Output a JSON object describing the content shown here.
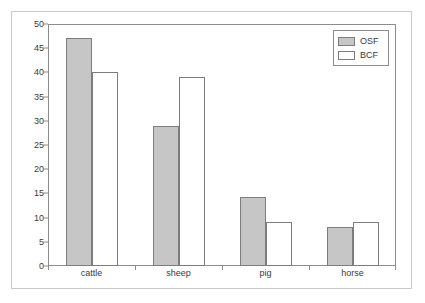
{
  "chart_data": {
    "type": "bar",
    "title": "",
    "xlabel": "",
    "ylabel": "",
    "categories": [
      "cattle",
      "sheep",
      "pig",
      "horse"
    ],
    "series": [
      {
        "name": "OSF",
        "color": "#c6c6c6",
        "values": [
          47.1,
          29.0,
          14.2,
          8.1
        ]
      },
      {
        "name": "BCF",
        "color": "#ffffff",
        "values": [
          40.0,
          39.0,
          9.0,
          9.1
        ]
      }
    ],
    "ylim": [
      0,
      50
    ],
    "yticks": [
      0,
      5,
      10,
      15,
      20,
      25,
      30,
      35,
      40,
      45,
      50
    ],
    "ytick_labels": [
      "0",
      "5",
      "10",
      "15",
      "20",
      "25",
      "30",
      "35",
      "40",
      "45",
      "50"
    ],
    "grid": false,
    "legend_position": "top-right",
    "legend_entries": [
      "OSF",
      "BCF"
    ],
    "annotations": []
  },
  "legend": {
    "entries": [
      {
        "label": "OSF",
        "swatch": "osf"
      },
      {
        "label": "BCF",
        "swatch": "bcf"
      }
    ]
  },
  "colors": {
    "osf_fill": "#c6c6c6",
    "bcf_fill": "#ffffff",
    "bar_stroke": "#7d7d7d",
    "axis": "#8c8c8c",
    "text": "#3a3a3a",
    "outer_frame": "#c9c9c9",
    "background": "#ffffff"
  }
}
